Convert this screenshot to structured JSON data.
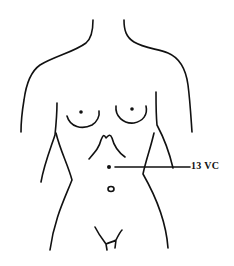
{
  "diagram": {
    "point": {
      "label": "13 VC",
      "marker": "dot"
    },
    "colors": {
      "line": "#111111",
      "background": "#ffffff"
    }
  }
}
